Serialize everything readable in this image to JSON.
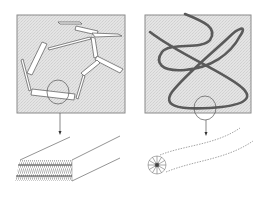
{
  "figure": {
    "background": "#ffffff",
    "panel_fill": "#e2e2e2",
    "panel_border": "#888888",
    "line_color": "#555555",
    "chain_color": "#5a5a5a",
    "panels": [
      {
        "id": "left",
        "depicts": "rigid-rod polymer segments joined by flexible links",
        "x": 17,
        "y": 15,
        "w": 108,
        "h": 98,
        "zoom_target": "lamellar / bundled fiber block"
      },
      {
        "id": "right",
        "depicts": "flexible coiled polymer chain",
        "x": 145,
        "y": 15,
        "w": 106,
        "h": 98,
        "zoom_target": "micelle-like star head with trailing dashed tails"
      }
    ]
  }
}
